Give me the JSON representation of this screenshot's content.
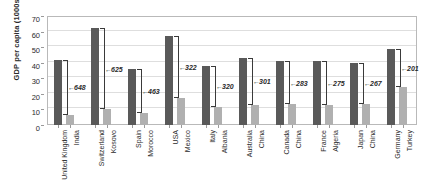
{
  "chart_data": {
    "type": "bar",
    "title": "",
    "xlabel": "",
    "ylabel": "GDP per capita (1000s)",
    "ylim": [
      0,
      70
    ],
    "ytick_labels": [
      "0",
      "10",
      "20",
      "30",
      "40",
      "50",
      "60",
      "70"
    ],
    "ytick_values": [
      0,
      10,
      20,
      30,
      40,
      50,
      60,
      70
    ],
    "grid": true,
    "legend": "none",
    "categories": [
      "United Kingdom",
      "India",
      "Switzerland",
      "Kosovo",
      "Spain",
      "Morocco",
      "USA",
      "Mexico",
      "Italy",
      "Albania",
      "Australia",
      "China",
      "Canada",
      "China",
      "France",
      "Algeria",
      "Japan",
      "China",
      "Germany",
      "Turkey"
    ],
    "values": [
      42,
      6.5,
      62,
      10,
      36,
      7.5,
      57,
      17.5,
      38,
      11.5,
      43,
      13,
      41,
      13.5,
      41,
      13,
      40,
      13.5,
      49,
      24.5
    ],
    "pairs": [
      {
        "rich": "United Kingdom",
        "rich_value": 42,
        "poor": "India",
        "poor_value": 6.5,
        "annotation": "648"
      },
      {
        "rich": "Switzerland",
        "rich_value": 62,
        "poor": "Kosovo",
        "poor_value": 10,
        "annotation": "625"
      },
      {
        "rich": "Spain",
        "rich_value": 36,
        "poor": "Morocco",
        "poor_value": 7.5,
        "annotation": "463"
      },
      {
        "rich": "USA",
        "rich_value": 57,
        "poor": "Mexico",
        "poor_value": 17.5,
        "annotation": "322"
      },
      {
        "rich": "Italy",
        "rich_value": 38,
        "poor": "Albania",
        "poor_value": 11.5,
        "annotation": "320"
      },
      {
        "rich": "Australia",
        "rich_value": 43,
        "poor": "China",
        "poor_value": 13,
        "annotation": "301"
      },
      {
        "rich": "Canada",
        "rich_value": 41,
        "poor": "China",
        "poor_value": 13.5,
        "annotation": "283"
      },
      {
        "rich": "France",
        "rich_value": 41,
        "poor": "Algeria",
        "poor_value": 13,
        "annotation": "275"
      },
      {
        "rich": "Japan",
        "rich_value": 40,
        "poor": "China",
        "poor_value": 13.5,
        "annotation": "267"
      },
      {
        "rich": "Germany",
        "rich_value": 49,
        "poor": "Turkey",
        "poor_value": 24.5,
        "annotation": "201"
      }
    ],
    "colors": {
      "rich_bar": "#595959",
      "poor_bar": "#b0b0b0",
      "gridline": "#dedede",
      "axis": "#b9b9b9",
      "text": "#2b2b2b"
    }
  }
}
